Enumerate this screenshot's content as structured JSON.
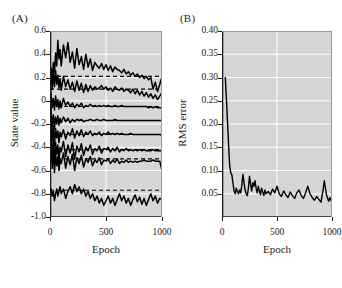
{
  "figure": {
    "panel_a_label": "(A)",
    "panel_b_label": "(B)"
  },
  "chart_data": [
    {
      "type": "line",
      "panel": "(A)",
      "title": "",
      "xlabel": "Epoch",
      "ylabel": "State value",
      "xlim": [
        0,
        1000
      ],
      "ylim": [
        -1.0,
        0.6
      ],
      "xticks": [
        0,
        500,
        1000
      ],
      "xticklabels": [
        "0",
        "500",
        "1000"
      ],
      "yticks": [
        0.6,
        0.4,
        0.2,
        0,
        -0.2,
        -0.4,
        -0.6,
        -0.8,
        -1.0
      ],
      "yticklabels": [
        "0.6",
        "0.4",
        "0.2",
        "0",
        "-0.2",
        "-0.4",
        "-0.6",
        "-0.8",
        "-1.0"
      ],
      "grid": true,
      "grid_color": "#ffffff",
      "plot_background": "#d6d6d6",
      "line_color": "#000000",
      "legend": "none",
      "reference_lines": [
        {
          "name": "target-1",
          "value": 0.21,
          "style": "dashed"
        },
        {
          "name": "target-2",
          "value": 0.1,
          "style": "dashed"
        },
        {
          "name": "target-3",
          "value": -0.05,
          "style": "dashed"
        },
        {
          "name": "target-4",
          "value": -0.17,
          "style": "dashed"
        },
        {
          "name": "target-5",
          "value": -0.29,
          "style": "dashed"
        },
        {
          "name": "target-6",
          "value": -0.42,
          "style": "dashed"
        },
        {
          "name": "target-7",
          "value": -0.5,
          "style": "dashed"
        },
        {
          "name": "target-8",
          "value": -0.77,
          "style": "dashed"
        }
      ],
      "x": [
        0,
        10,
        20,
        30,
        40,
        50,
        60,
        70,
        80,
        90,
        100,
        120,
        140,
        160,
        180,
        200,
        220,
        240,
        260,
        280,
        300,
        320,
        340,
        360,
        380,
        400,
        420,
        440,
        460,
        480,
        500,
        520,
        540,
        560,
        580,
        600,
        620,
        640,
        660,
        680,
        700,
        720,
        740,
        760,
        780,
        800,
        820,
        840,
        860,
        880,
        900,
        920,
        940,
        960,
        980,
        1000
      ],
      "series": [
        {
          "name": "state-trace-1",
          "converges_to": 0.21,
          "values": [
            0.22,
            0.28,
            0.18,
            0.33,
            0.24,
            0.41,
            0.3,
            0.52,
            0.36,
            0.44,
            0.3,
            0.48,
            0.37,
            0.5,
            0.33,
            0.42,
            0.28,
            0.45,
            0.31,
            0.38,
            0.27,
            0.4,
            0.29,
            0.36,
            0.26,
            0.33,
            0.3,
            0.28,
            0.32,
            0.27,
            0.31,
            0.26,
            0.3,
            0.25,
            0.29,
            0.27,
            0.26,
            0.24,
            0.27,
            0.23,
            0.25,
            0.22,
            0.24,
            0.21,
            0.23,
            0.2,
            0.22,
            0.19,
            0.21,
            0.18,
            0.2,
            0.1,
            0.16,
            0.08,
            0.14,
            0.21
          ]
        },
        {
          "name": "state-trace-2",
          "converges_to": 0.1,
          "values": [
            0.15,
            0.2,
            0.1,
            0.24,
            0.12,
            0.26,
            0.14,
            0.22,
            0.11,
            0.19,
            0.09,
            0.21,
            0.12,
            0.18,
            0.1,
            0.16,
            0.08,
            0.17,
            0.09,
            0.15,
            0.07,
            0.14,
            0.08,
            0.13,
            0.09,
            0.12,
            0.1,
            0.11,
            0.13,
            0.1,
            0.12,
            0.09,
            0.11,
            0.08,
            0.12,
            0.1,
            0.09,
            0.11,
            0.08,
            0.1,
            0.09,
            0.07,
            0.1,
            0.06,
            0.09,
            0.05,
            0.08,
            0.04,
            0.07,
            0.03,
            0.06,
            0.02,
            0.05,
            0.01,
            0.04,
            0.07
          ]
        },
        {
          "name": "state-trace-3",
          "converges_to": -0.05,
          "values": [
            0.18,
            0.05,
            -0.06,
            0.02,
            -0.08,
            0.04,
            -0.05,
            0.01,
            -0.07,
            0.0,
            -0.06,
            0.02,
            -0.04,
            -0.01,
            -0.05,
            -0.02,
            -0.06,
            -0.03,
            -0.05,
            -0.02,
            -0.06,
            -0.04,
            -0.05,
            -0.03,
            -0.05,
            -0.04,
            -0.05,
            -0.04,
            -0.05,
            -0.04,
            -0.05,
            -0.04,
            -0.05,
            -0.05,
            -0.04,
            -0.05,
            -0.05,
            -0.04,
            -0.05,
            -0.05,
            -0.05,
            -0.05,
            -0.05,
            -0.05,
            -0.05,
            -0.05,
            -0.05,
            -0.05,
            -0.05,
            -0.06,
            -0.05,
            -0.06,
            -0.05,
            -0.06,
            -0.06,
            -0.06
          ]
        },
        {
          "name": "state-trace-4",
          "converges_to": -0.17,
          "values": [
            0.1,
            -0.1,
            -0.22,
            -0.12,
            -0.24,
            -0.14,
            -0.2,
            -0.13,
            -0.21,
            -0.15,
            -0.19,
            -0.14,
            -0.18,
            -0.15,
            -0.19,
            -0.16,
            -0.18,
            -0.16,
            -0.17,
            -0.16,
            -0.18,
            -0.17,
            -0.17,
            -0.16,
            -0.17,
            -0.17,
            -0.16,
            -0.17,
            -0.17,
            -0.16,
            -0.17,
            -0.17,
            -0.17,
            -0.17,
            -0.16,
            -0.17,
            -0.17,
            -0.17,
            -0.17,
            -0.17,
            -0.17,
            -0.17,
            -0.17,
            -0.17,
            -0.17,
            -0.17,
            -0.17,
            -0.17,
            -0.17,
            -0.17,
            -0.17,
            -0.17,
            -0.17,
            -0.17,
            -0.17,
            -0.17
          ]
        },
        {
          "name": "state-trace-5",
          "converges_to": -0.29,
          "values": [
            0.05,
            -0.18,
            -0.34,
            -0.22,
            -0.38,
            -0.24,
            -0.32,
            -0.26,
            -0.36,
            -0.27,
            -0.31,
            -0.25,
            -0.33,
            -0.27,
            -0.3,
            -0.24,
            -0.32,
            -0.26,
            -0.3,
            -0.25,
            -0.31,
            -0.27,
            -0.29,
            -0.26,
            -0.3,
            -0.28,
            -0.29,
            -0.27,
            -0.3,
            -0.28,
            -0.29,
            -0.27,
            -0.29,
            -0.28,
            -0.29,
            -0.28,
            -0.29,
            -0.28,
            -0.29,
            -0.29,
            -0.29,
            -0.28,
            -0.29,
            -0.29,
            -0.29,
            -0.29,
            -0.29,
            -0.29,
            -0.29,
            -0.29,
            -0.29,
            -0.29,
            -0.29,
            -0.29,
            -0.29,
            -0.3
          ]
        },
        {
          "name": "state-trace-6",
          "converges_to": -0.42,
          "values": [
            -0.42,
            -0.3,
            -0.5,
            -0.34,
            -0.54,
            -0.36,
            -0.46,
            -0.38,
            -0.52,
            -0.4,
            -0.44,
            -0.35,
            -0.48,
            -0.38,
            -0.45,
            -0.36,
            -0.5,
            -0.39,
            -0.44,
            -0.37,
            -0.47,
            -0.4,
            -0.43,
            -0.38,
            -0.46,
            -0.41,
            -0.43,
            -0.39,
            -0.45,
            -0.41,
            -0.42,
            -0.4,
            -0.44,
            -0.41,
            -0.43,
            -0.4,
            -0.44,
            -0.42,
            -0.43,
            -0.41,
            -0.43,
            -0.42,
            -0.43,
            -0.42,
            -0.43,
            -0.42,
            -0.43,
            -0.42,
            -0.43,
            -0.43,
            -0.43,
            -0.42,
            -0.43,
            -0.43,
            -0.43,
            -0.43
          ]
        },
        {
          "name": "state-trace-7",
          "converges_to": -0.5,
          "values": [
            -0.46,
            -0.4,
            -0.58,
            -0.44,
            -0.62,
            -0.46,
            -0.56,
            -0.48,
            -0.6,
            -0.5,
            -0.54,
            -0.45,
            -0.58,
            -0.48,
            -0.55,
            -0.46,
            -0.6,
            -0.49,
            -0.54,
            -0.47,
            -0.57,
            -0.5,
            -0.53,
            -0.48,
            -0.56,
            -0.51,
            -0.53,
            -0.49,
            -0.55,
            -0.51,
            -0.52,
            -0.5,
            -0.54,
            -0.51,
            -0.53,
            -0.5,
            -0.54,
            -0.52,
            -0.53,
            -0.51,
            -0.53,
            -0.52,
            -0.53,
            -0.52,
            -0.53,
            -0.52,
            -0.52,
            -0.51,
            -0.52,
            -0.52,
            -0.52,
            -0.51,
            -0.52,
            -0.52,
            -0.52,
            -0.6
          ]
        },
        {
          "name": "state-trace-8",
          "converges_to": -0.77,
          "values": [
            -0.76,
            -0.76,
            -0.82,
            -0.78,
            -0.86,
            -0.8,
            -0.76,
            -0.82,
            -0.78,
            -0.74,
            -0.8,
            -0.76,
            -0.84,
            -0.78,
            -0.74,
            -0.8,
            -0.72,
            -0.78,
            -0.74,
            -0.8,
            -0.76,
            -0.82,
            -0.78,
            -0.84,
            -0.8,
            -0.86,
            -0.82,
            -0.88,
            -0.84,
            -0.9,
            -0.86,
            -0.82,
            -0.88,
            -0.84,
            -0.9,
            -0.85,
            -0.8,
            -0.86,
            -0.82,
            -0.88,
            -0.84,
            -0.9,
            -0.85,
            -0.81,
            -0.87,
            -0.83,
            -0.89,
            -0.84,
            -0.9,
            -0.85,
            -0.8,
            -0.86,
            -0.82,
            -0.88,
            -0.84,
            -0.85
          ]
        }
      ]
    },
    {
      "type": "line",
      "panel": "(B)",
      "title": "",
      "xlabel": "Epoch",
      "ylabel": "RMS error",
      "xlim": [
        0,
        1000
      ],
      "ylim": [
        0,
        0.4
      ],
      "xticks": [
        0,
        500,
        1000
      ],
      "xticklabels": [
        "0",
        "500",
        "1000"
      ],
      "yticks": [
        0.4,
        0.35,
        0.3,
        0.25,
        0.2,
        0.15,
        0.1,
        0.05
      ],
      "yticklabels": [
        "0.40",
        "0.35",
        "0.30",
        "0.25",
        "0.20",
        "0.15",
        "0.10",
        "0.05"
      ],
      "grid": true,
      "grid_color": "#ffffff",
      "plot_background": "#d6d6d6",
      "line_color": "#000000",
      "legend": "none",
      "x": [
        30,
        40,
        50,
        60,
        70,
        80,
        90,
        100,
        110,
        120,
        130,
        140,
        150,
        160,
        170,
        180,
        190,
        200,
        210,
        220,
        230,
        240,
        250,
        260,
        270,
        280,
        290,
        300,
        310,
        320,
        330,
        340,
        350,
        360,
        370,
        380,
        390,
        400,
        420,
        440,
        460,
        480,
        500,
        520,
        540,
        560,
        580,
        600,
        620,
        640,
        660,
        680,
        700,
        720,
        740,
        760,
        780,
        800,
        820,
        840,
        860,
        880,
        900,
        910,
        920,
        930,
        940,
        950,
        960,
        970,
        980,
        990,
        1000
      ],
      "values": [
        0.3,
        0.255,
        0.205,
        0.155,
        0.11,
        0.095,
        0.09,
        0.072,
        0.056,
        0.05,
        0.062,
        0.055,
        0.05,
        0.058,
        0.052,
        0.068,
        0.092,
        0.074,
        0.058,
        0.05,
        0.046,
        0.062,
        0.088,
        0.07,
        0.056,
        0.074,
        0.066,
        0.078,
        0.062,
        0.052,
        0.066,
        0.056,
        0.048,
        0.062,
        0.054,
        0.046,
        0.058,
        0.05,
        0.055,
        0.048,
        0.06,
        0.052,
        0.066,
        0.05,
        0.044,
        0.056,
        0.048,
        0.042,
        0.054,
        0.046,
        0.04,
        0.052,
        0.058,
        0.046,
        0.04,
        0.052,
        0.066,
        0.05,
        0.042,
        0.036,
        0.044,
        0.038,
        0.032,
        0.046,
        0.06,
        0.078,
        0.062,
        0.048,
        0.04,
        0.034,
        0.042,
        0.036,
        0.034
      ]
    }
  ]
}
